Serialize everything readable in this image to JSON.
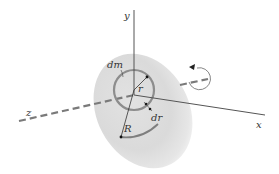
{
  "diagram": {
    "axes": {
      "x": {
        "label": "x"
      },
      "y": {
        "label": "y"
      },
      "z": {
        "label": "z"
      }
    },
    "labels": {
      "mass_element": "dm",
      "inner_radius": "r",
      "ring_width": "dr",
      "outer_radius": "R"
    },
    "icons": {
      "rotation": "circular-arrow-icon"
    },
    "colors": {
      "disk_fill": "#dcdcdc",
      "ring_stroke": "#8a8a8a",
      "axis_stroke": "#555555",
      "dashed_axis": "#7a7a7a",
      "background": "#ffffff"
    }
  }
}
